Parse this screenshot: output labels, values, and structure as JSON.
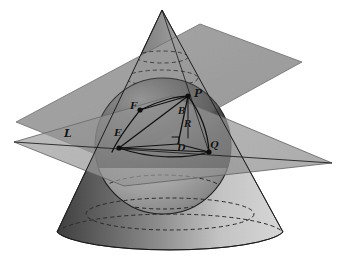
{
  "figure": {
    "background_color": "#ffffff",
    "ink_color": "#141414"
  },
  "colors": {
    "plane_upper": "#a6a6a6",
    "plane_lower": "#9b9b9b",
    "plane_overlap": "#7d7d7d",
    "cone_light": "#d9d9d9",
    "cone_dark": "#4a4a4a",
    "sphere_light": "#cfcfcf",
    "sphere_dark": "#2b2b2b",
    "outline": "#1a1a1a",
    "dashed": "#2a2a2a"
  },
  "objects": [
    {
      "name": "cone",
      "kind": "surface",
      "apex": [
        162,
        10
      ],
      "base_center": [
        170,
        232
      ],
      "base_rx": 115,
      "base_ry": 22
    },
    {
      "name": "inscribed-sphere",
      "kind": "surface",
      "center": [
        163,
        146
      ],
      "r": 68
    },
    {
      "name": "upper-cutting-plane",
      "kind": "plane"
    },
    {
      "name": "lower-cutting-plane",
      "kind": "plane"
    },
    {
      "name": "tangent-circle-upper",
      "kind": "dashed-ellipse"
    },
    {
      "name": "tangent-circle-lower",
      "kind": "dashed-ellipse"
    }
  ],
  "points": [
    {
      "id": "P",
      "label": "P",
      "x": 188,
      "y": 96,
      "lx": 194,
      "ly": 88,
      "marker": true
    },
    {
      "id": "F",
      "label": "F",
      "x": 140,
      "y": 110,
      "lx": 130,
      "ly": 101,
      "marker": true
    },
    {
      "id": "B",
      "label": "B",
      "x": 182,
      "y": 112,
      "lx": 178,
      "ly": 107,
      "marker": false
    },
    {
      "id": "R",
      "label": "R",
      "x": 187,
      "y": 125,
      "lx": 184,
      "ly": 120,
      "marker": false
    },
    {
      "id": "E",
      "label": "E",
      "x": 119,
      "y": 148,
      "lx": 114,
      "ly": 128,
      "marker": true
    },
    {
      "id": "D",
      "label": "D",
      "x": 178,
      "y": 144,
      "lx": 177,
      "ly": 143,
      "marker": false
    },
    {
      "id": "Q",
      "label": "Q",
      "x": 209,
      "y": 152,
      "lx": 210,
      "ly": 140,
      "marker": true
    },
    {
      "id": "L",
      "label": "L",
      "x": 70,
      "y": 136,
      "lx": 64,
      "ly": 128,
      "marker": false
    }
  ],
  "segments": [
    {
      "name": "segment-F-P",
      "from": "F",
      "to": "P"
    },
    {
      "name": "segment-P-E",
      "from": "P",
      "to": "E"
    },
    {
      "name": "segment-P-D",
      "from": "P",
      "to": "D"
    },
    {
      "name": "segment-E-D",
      "from": "E",
      "to": "D"
    },
    {
      "name": "segment-E-Q",
      "from": "E",
      "to": "Q"
    },
    {
      "name": "segment-D-Q",
      "from": "D",
      "to": "Q"
    },
    {
      "name": "segment-F-E",
      "from": "F",
      "to": "E"
    },
    {
      "name": "segment-P-Q",
      "from": "P",
      "to": "Q"
    },
    {
      "name": "right-angle-mark-at-D",
      "from": "D",
      "to": "D"
    }
  ],
  "labels": {
    "line_of_intersection": "L"
  }
}
